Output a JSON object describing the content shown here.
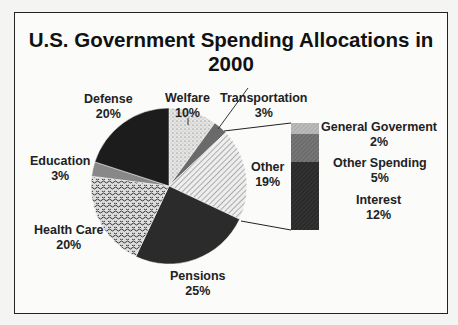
{
  "chart_data": {
    "type": "pie",
    "title": "U.S. Government Spending Allocations in 2000",
    "slices": [
      {
        "label": "Welfare",
        "value": 10
      },
      {
        "label": "Transportation",
        "value": 3
      },
      {
        "label": "Other",
        "value": 19
      },
      {
        "label": "Pensions",
        "value": 25
      },
      {
        "label": "Health Care",
        "value": 20
      },
      {
        "label": "Education",
        "value": 3
      },
      {
        "label": "Defense",
        "value": 20
      }
    ],
    "breakdown": {
      "of": "Other",
      "type": "stacked-bar",
      "segments": [
        {
          "label": "General Goverment",
          "value": 2
        },
        {
          "label": "Other Spending",
          "value": 5
        },
        {
          "label": "Interest",
          "value": 12
        }
      ]
    },
    "legend": "none (direct labels)"
  },
  "labels": {
    "welfare": {
      "name": "Welfare",
      "pct": "10%"
    },
    "transportation": {
      "name": "Transportation",
      "pct": "3%"
    },
    "other": {
      "name": "Other",
      "pct": "19%"
    },
    "pensions": {
      "name": "Pensions",
      "pct": "25%"
    },
    "health": {
      "name": "Health Care",
      "pct": "20%"
    },
    "education": {
      "name": "Education",
      "pct": "3%"
    },
    "defense": {
      "name": "Defense",
      "pct": "20%"
    },
    "general": {
      "name": "General Goverment",
      "pct": "2%"
    },
    "otherspending": {
      "name": "Other Spending",
      "pct": "5%"
    },
    "interest": {
      "name": "Interest",
      "pct": "12%"
    }
  }
}
